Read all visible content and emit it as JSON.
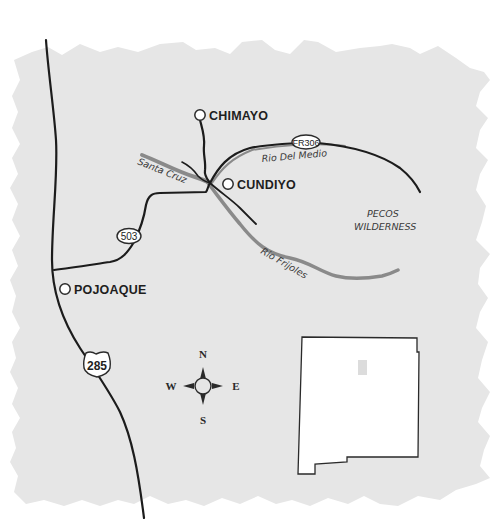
{
  "map": {
    "background_color": "#e6e6e6",
    "road_color": "#1c1c1c",
    "river_color": "#8a8a8a",
    "towns": [
      {
        "name": "CHIMAYO"
      },
      {
        "name": "CUNDIYO"
      },
      {
        "name": "POJOAQUE"
      }
    ],
    "rivers": [
      {
        "name": "Santa Cruz"
      },
      {
        "name": "Rio Del Medio"
      },
      {
        "name": "Rio Frijoles"
      }
    ],
    "areas": [
      {
        "line1": "PECOS",
        "line2": "WILDERNESS"
      }
    ],
    "route_shields": [
      {
        "label": "FR306",
        "type": "forest-road-oval"
      },
      {
        "label": "503",
        "type": "state-route-oval"
      },
      {
        "label": "285",
        "type": "us-highway-shield"
      }
    ],
    "compass": {
      "north": "N",
      "south": "S",
      "east": "E",
      "west": "W"
    },
    "inset": {
      "name": "new-mexico-locator",
      "fill": "#ffffff",
      "highlight_color": "#dcdcdc"
    }
  }
}
